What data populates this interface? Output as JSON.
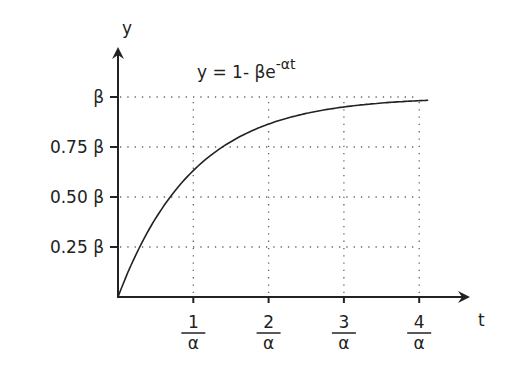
{
  "chart_data": {
    "type": "line",
    "title": "y = 1- βe",
    "title_exponent": "-αt",
    "xlabel": "t",
    "ylabel": "y",
    "x_ticks": [
      {
        "num": "1",
        "den": "α",
        "value": 1
      },
      {
        "num": "2",
        "den": "α",
        "value": 2
      },
      {
        "num": "3",
        "den": "α",
        "value": 3
      },
      {
        "num": "4",
        "den": "α",
        "value": 4
      }
    ],
    "y_ticks": [
      {
        "label": "β",
        "value": 1.0
      },
      {
        "label": "0.75 β",
        "value": 0.75
      },
      {
        "label": "0.50 β",
        "value": 0.5
      },
      {
        "label": "0.25 β",
        "value": 0.25
      }
    ],
    "xlim": [
      0,
      4.3
    ],
    "ylim": [
      0,
      1
    ],
    "grid": "dotted",
    "series": [
      {
        "name": "y = 1- βe^-αt",
        "x": [
          0,
          0.25,
          0.5,
          0.75,
          1,
          1.5,
          2,
          2.5,
          3,
          3.5,
          4,
          4.12
        ],
        "values": [
          0,
          0.22,
          0.39,
          0.53,
          0.63,
          0.78,
          0.86,
          0.92,
          0.95,
          0.97,
          0.98,
          0.98
        ]
      }
    ]
  }
}
